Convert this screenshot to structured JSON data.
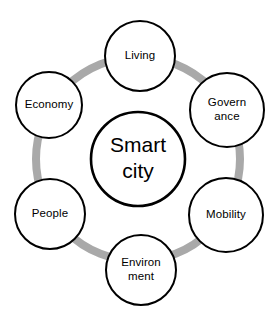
{
  "diagram": {
    "type": "hub-and-spoke-hexagon",
    "canvas": {
      "width": 277,
      "height": 320,
      "background": "#ffffff"
    },
    "colors": {
      "ring": "#a9a9a9",
      "node_stroke": "#000000",
      "node_fill": "#ffffff",
      "text": "#000000"
    },
    "center": {
      "name": "smart-city-hub",
      "line1": "Smart",
      "line2": "city",
      "cx": 138,
      "cy": 159,
      "r": 47,
      "stroke_width": 2.6
    },
    "ring": {
      "cx": 138,
      "cy": 159,
      "r": 102,
      "stroke_width": 8
    },
    "nodes": [
      {
        "id": "living",
        "name": "node-living",
        "line1": "Living",
        "line2": "",
        "cx": 140,
        "cy": 56,
        "r": 35,
        "stroke_width": 2
      },
      {
        "id": "governance",
        "name": "node-governance",
        "line1": "Govern",
        "line2": "ance",
        "cx": 227,
        "cy": 110,
        "r": 37,
        "stroke_width": 2
      },
      {
        "id": "mobility",
        "name": "node-mobility",
        "line1": "Mobility",
        "line2": "",
        "cx": 226,
        "cy": 215,
        "r": 37,
        "stroke_width": 2
      },
      {
        "id": "environment",
        "name": "node-environment",
        "line1": "Environ",
        "line2": "ment",
        "cx": 141,
        "cy": 270,
        "r": 35,
        "stroke_width": 2
      },
      {
        "id": "people",
        "name": "node-people",
        "line1": "People",
        "line2": "",
        "cx": 50,
        "cy": 214,
        "r": 35,
        "stroke_width": 2
      },
      {
        "id": "economy",
        "name": "node-economy",
        "line1": "Economy",
        "line2": "",
        "cx": 49,
        "cy": 105,
        "r": 33,
        "stroke_width": 2
      }
    ]
  }
}
